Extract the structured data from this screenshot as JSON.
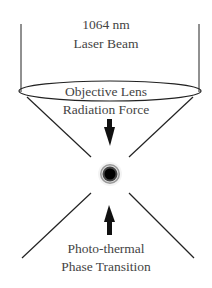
{
  "labels": {
    "beam_line1": "1064 nm",
    "beam_line2": "Laser Beam",
    "lens": "Objective Lens",
    "force": "Radiation Force",
    "transition_line1": "Photo-thermal",
    "transition_line2": "Phase Transition"
  },
  "colors": {
    "line": "#222222",
    "text": "#444444",
    "particle_core": "#000000",
    "particle_ring": "#888888"
  }
}
